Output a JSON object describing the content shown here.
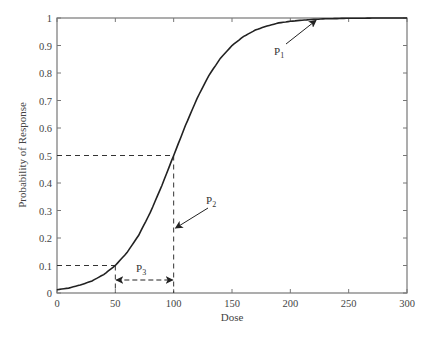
{
  "chart_data": {
    "type": "line",
    "title": "",
    "xlabel": "Dose",
    "ylabel": "Probability of Response",
    "xlim": [
      0,
      300
    ],
    "ylim": [
      0,
      1
    ],
    "xticks": [
      0,
      50,
      100,
      150,
      200,
      250,
      300
    ],
    "yticks": [
      0,
      0.1,
      0.2,
      0.3,
      0.4,
      0.5,
      0.6,
      0.7,
      0.8,
      0.9,
      1
    ],
    "ytick_labels": [
      "0",
      "0.1",
      "0.2",
      "0.3",
      "0.4",
      "0.5",
      "0.6",
      "0.7",
      "0.8",
      "0.9",
      "1"
    ],
    "grid": false,
    "legend": null,
    "series": [
      {
        "name": "dose-response curve",
        "x": [
          0,
          10,
          20,
          30,
          40,
          50,
          60,
          70,
          80,
          90,
          100,
          110,
          120,
          130,
          140,
          150,
          160,
          170,
          180,
          190,
          200,
          210,
          220,
          230,
          240,
          250,
          260,
          270,
          280,
          290,
          300
        ],
        "y": [
          0.012,
          0.018,
          0.029,
          0.044,
          0.067,
          0.1,
          0.147,
          0.21,
          0.293,
          0.392,
          0.5,
          0.608,
          0.707,
          0.79,
          0.853,
          0.9,
          0.933,
          0.956,
          0.971,
          0.982,
          0.988,
          0.992,
          0.995,
          0.997,
          0.998,
          0.999,
          0.999,
          1.0,
          1.0,
          1.0,
          1.0
        ]
      }
    ],
    "reference_lines": [
      {
        "type": "dashed",
        "from": [
          0,
          0.5
        ],
        "to": [
          100,
          0.5
        ]
      },
      {
        "type": "dashed",
        "from": [
          100,
          0.5
        ],
        "to": [
          100,
          0
        ]
      },
      {
        "type": "dashed",
        "from": [
          0,
          0.1
        ],
        "to": [
          50,
          0.1
        ]
      },
      {
        "type": "dashed",
        "from": [
          50,
          0.1
        ],
        "to": [
          50,
          0
        ]
      }
    ],
    "annotations": [
      {
        "label": "P",
        "subscript": "1",
        "text": "P1",
        "points_to": [
          222,
          0.995
        ],
        "description": "arrow to upper plateau of curve"
      },
      {
        "label": "P",
        "subscript": "2",
        "text": "P2",
        "points_to": [
          100,
          0.24
        ],
        "description": "arrow to dashed line at dose 100"
      },
      {
        "label": "P",
        "subscript": "3",
        "text": "P3",
        "span": [
          50,
          100
        ],
        "at_y": 0.05,
        "description": "double-headed dashed arrow between doses 50 and 100"
      }
    ]
  }
}
